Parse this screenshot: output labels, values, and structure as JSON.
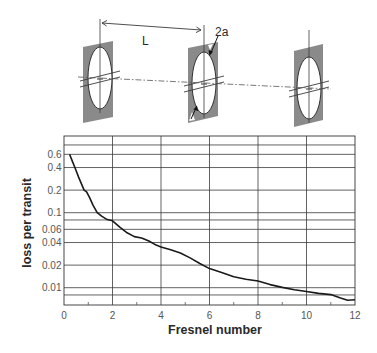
{
  "diagram": {
    "distance_label": "L",
    "aperture_label": "2a",
    "plates": [
      {
        "name": "mirror-1",
        "corners": [
          [
            83,
            47
          ],
          [
            113,
            41
          ],
          [
            113,
            117
          ],
          [
            83,
            123
          ]
        ],
        "center": [
          100,
          78
        ],
        "rx": 12,
        "ry": 31,
        "axis_top": 19
      },
      {
        "name": "mirror-2",
        "corners": [
          [
            188,
            48
          ],
          [
            218,
            42
          ],
          [
            218,
            116
          ],
          [
            188,
            123
          ]
        ],
        "center": [
          204,
          83
        ],
        "rx": 12,
        "ry": 31,
        "axis_top": 25
      },
      {
        "name": "mirror-3",
        "corners": [
          [
            294,
            51
          ],
          [
            323,
            44
          ],
          [
            323,
            120
          ],
          [
            294,
            127
          ]
        ],
        "center": [
          309,
          88
        ],
        "rx": 12,
        "ry": 31,
        "axis_top": 30
      }
    ],
    "colors": {
      "plate": "#8a8a8a",
      "line": "#3a3a3a"
    }
  },
  "chart_data": {
    "type": "line",
    "title": "",
    "xlabel": "Fresnel number",
    "ylabel": "loss per transit",
    "xlim": [
      0,
      12
    ],
    "ylim": [
      0.006,
      1.0
    ],
    "yscale": "log",
    "grid": true,
    "legend": null,
    "x_ticks": [
      0,
      2,
      4,
      6,
      8,
      10,
      12
    ],
    "x_tick_labels": [
      "0",
      "2",
      "4",
      "6",
      "8",
      "10",
      "12"
    ],
    "x_minor_ticks": [
      1,
      3,
      5,
      7,
      9,
      11
    ],
    "y_ticks": [
      0.6,
      0.4,
      0.2,
      0.1,
      0.06,
      0.04,
      0.02,
      0.01
    ],
    "y_tick_labels": [
      "0.6",
      "0.4",
      "0.2",
      "0.1",
      "0.06",
      "0.04",
      "0.02",
      "0.01"
    ],
    "y_gridlines": [
      0.8,
      0.6,
      0.4,
      0.2,
      0.1,
      0.08,
      0.06,
      0.04,
      0.02,
      0.01,
      0.008
    ],
    "series": [
      {
        "name": "loss per transit",
        "color": "#1a1a1a",
        "x": [
          0.23,
          0.35,
          0.45,
          0.6,
          0.75,
          0.83,
          0.93,
          1.05,
          1.2,
          1.37,
          1.55,
          1.75,
          2.0,
          2.3,
          2.6,
          2.9,
          3.2,
          3.5,
          3.8,
          4.0,
          4.4,
          4.8,
          5.2,
          5.6,
          6.0,
          6.5,
          7.0,
          7.5,
          8.0,
          8.5,
          9.0,
          9.5,
          10.0,
          10.5,
          11.0,
          11.4,
          11.7,
          12.0
        ],
        "values": [
          0.6,
          0.48,
          0.4,
          0.3,
          0.23,
          0.2,
          0.19,
          0.16,
          0.125,
          0.1,
          0.09,
          0.082,
          0.078,
          0.064,
          0.054,
          0.048,
          0.046,
          0.042,
          0.037,
          0.035,
          0.032,
          0.029,
          0.025,
          0.021,
          0.018,
          0.016,
          0.014,
          0.013,
          0.0123,
          0.011,
          0.0101,
          0.0094,
          0.0089,
          0.0084,
          0.0081,
          0.0073,
          0.0068,
          0.0069
        ]
      }
    ]
  }
}
